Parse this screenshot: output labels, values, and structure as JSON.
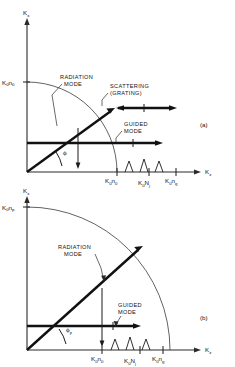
{
  "figure": {
    "type": "diagram",
    "panels": [
      {
        "id": "a",
        "panel_label": "(a)",
        "axis_y_label": "K",
        "axis_y_sub": "x",
        "axis_x_label": "K",
        "axis_x_sub": "z",
        "y_intercept_label": "K₀n₀",
        "y_intercept_label_base": "K",
        "y_intercept_sub1": "0",
        "y_intercept_mid": "n",
        "y_intercept_sub2": "0",
        "annotations": [
          {
            "name": "radiation-mode",
            "line1": "RADIATION",
            "line2": "MODE"
          },
          {
            "name": "scattering-grating",
            "line1": "SCATTERING",
            "line2": "(GRATING)"
          },
          {
            "name": "guided-mode",
            "line1": "GUIDED",
            "line2": "MODE"
          }
        ],
        "angle_label": "ϕ",
        "x_ticks": [
          {
            "base": "K",
            "sub1": "0",
            "mid": "n",
            "sub2": "0"
          },
          {
            "base": "K",
            "sub1": "0",
            "mid": "N",
            "sub2": "j"
          },
          {
            "base": "K",
            "sub1": "0",
            "mid": "n",
            "sub2": "g"
          }
        ]
      },
      {
        "id": "b",
        "panel_label": "(b)",
        "axis_y_label": "K",
        "axis_y_sub": "x",
        "axis_x_label": "K",
        "axis_x_sub": "z",
        "y_intercept_label": "K₀nₚ",
        "y_intercept_label_base": "K",
        "y_intercept_sub1": "0",
        "y_intercept_mid": "n",
        "y_intercept_sub2": "p",
        "annotations": [
          {
            "name": "radiation-mode",
            "line1": "RADIATION",
            "line2": "MODE"
          },
          {
            "name": "guided-mode",
            "line1": "GUIDED",
            "line2": "MODE"
          }
        ],
        "angle_label": "ϕ",
        "angle_label_sub": "p",
        "x_ticks": [
          {
            "base": "K",
            "sub1": "0",
            "mid": "n",
            "sub2": "0"
          },
          {
            "base": "K",
            "sub1": "0",
            "mid": "N",
            "sub2": "j"
          },
          {
            "base": "K",
            "sub1": "0",
            "mid": "n",
            "sub2": "g"
          }
        ]
      }
    ],
    "colors": {
      "ink": "#111111",
      "axis": "#2a2a2a",
      "background": "#ffffff"
    }
  }
}
